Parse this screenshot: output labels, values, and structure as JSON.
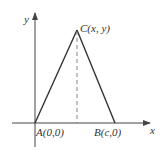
{
  "diagram": {
    "type": "coordinate-geometry-triangle",
    "axes": {
      "x_label": "x",
      "y_label": "y"
    },
    "points": [
      {
        "id": "A",
        "label": "A(0,0)",
        "x": 35,
        "y": 123
      },
      {
        "id": "B",
        "label": "B(c,0)",
        "x": 115,
        "y": 123
      },
      {
        "id": "C",
        "label": "C(x, y)",
        "x": 77,
        "y": 30
      }
    ],
    "edges": [
      {
        "from": "A",
        "to": "C",
        "style": "solid"
      },
      {
        "from": "C",
        "to": "B",
        "style": "solid"
      },
      {
        "from": "C",
        "to": "foot",
        "style": "dashed",
        "description": "altitude from C to x-axis"
      }
    ],
    "colors": {
      "line": "#333333",
      "axis": "#444444",
      "dashed": "#666666",
      "background": "#ffffff"
    }
  }
}
